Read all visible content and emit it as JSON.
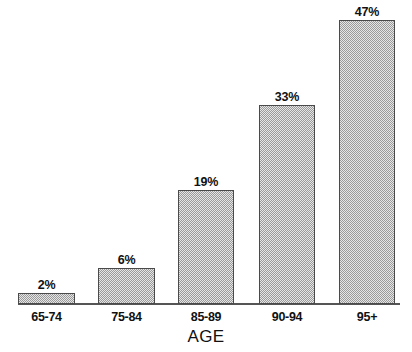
{
  "chart_data": {
    "type": "bar",
    "title": "",
    "subtitle": "",
    "xlabel": "AGE",
    "ylabel": "",
    "categories": [
      "65-74",
      "75-84",
      "85-89",
      "90-94",
      "95+"
    ],
    "values": [
      2,
      6,
      19,
      33,
      47
    ],
    "value_labels": [
      "2%",
      "6%",
      "19%",
      "33%",
      "47%"
    ],
    "unit": "%",
    "ylim": [
      0,
      47
    ],
    "grid": false,
    "legend": null,
    "legend_position": "none",
    "annotations": [],
    "axis": {
      "x_axis_visible": true,
      "y_axis_visible": false,
      "tick_labels": [
        "65-74",
        "75-84",
        "85-89",
        "90-94",
        "95+"
      ]
    },
    "style": {
      "bar_fill": "#e6e6e6",
      "bar_pattern": "fine-checkerboard-stipple",
      "bar_pattern_color": "#9a9a9a",
      "bar_border": "#4a4a4a",
      "axis_color": "#555555",
      "text_color": "#111111",
      "background": "#ffffff"
    }
  },
  "layout": {
    "bars": [
      {
        "left": 18,
        "width": 57,
        "height_px": 11,
        "label_left": 18,
        "label_bottom": 60
      },
      {
        "left": 98,
        "width": 57,
        "height_px": 36,
        "label_left": 98,
        "label_bottom": 85
      },
      {
        "left": 178,
        "width": 56,
        "height_px": 114,
        "label_left": 178,
        "label_bottom": 163
      },
      {
        "left": 259,
        "width": 56,
        "height_px": 199,
        "label_left": 259,
        "label_bottom": 248
      },
      {
        "left": 339,
        "width": 56,
        "height_px": 284,
        "label_left": 339,
        "label_bottom": 333
      }
    ],
    "ticks": [
      {
        "left": 18,
        "width": 57
      },
      {
        "left": 98,
        "width": 57
      },
      {
        "left": 178,
        "width": 56
      },
      {
        "left": 259,
        "width": 56
      },
      {
        "left": 339,
        "width": 56
      }
    ]
  }
}
